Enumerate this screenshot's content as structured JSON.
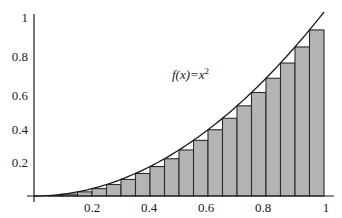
{
  "chart_data": {
    "type": "bar",
    "title": "",
    "xlabel": "",
    "ylabel": "",
    "annotation": "f(x)=x²",
    "function": "x^2",
    "xlim": [
      0,
      1
    ],
    "ylim": [
      0,
      1
    ],
    "grid": false,
    "legend": null,
    "x_ticks": [
      "0.2",
      "0.4",
      "0.6",
      "0.8",
      "1"
    ],
    "y_ticks": [
      "0.2",
      "0.4",
      "0.6",
      "0.8",
      "1"
    ],
    "bar_width": 0.05,
    "bar_rule": "left-endpoint (lower Riemann sum)",
    "x": [
      0.0,
      0.05,
      0.1,
      0.15,
      0.2,
      0.25,
      0.3,
      0.35,
      0.4,
      0.45,
      0.5,
      0.55,
      0.6,
      0.65,
      0.7,
      0.75,
      0.8,
      0.85,
      0.9,
      0.95
    ],
    "values": [
      0.0,
      0.0025,
      0.01,
      0.0225,
      0.04,
      0.0625,
      0.09,
      0.1225,
      0.16,
      0.2025,
      0.25,
      0.3025,
      0.36,
      0.4225,
      0.49,
      0.5625,
      0.64,
      0.7225,
      0.81,
      0.9025
    ]
  },
  "labels": {
    "function": "f(x)=x",
    "exponent": "2"
  },
  "colors": {
    "bar_fill": "#b4b4b4",
    "bar_stroke": "#2a2a2a",
    "axis": "#1a1a1a",
    "curve": "#1a1a1a"
  }
}
